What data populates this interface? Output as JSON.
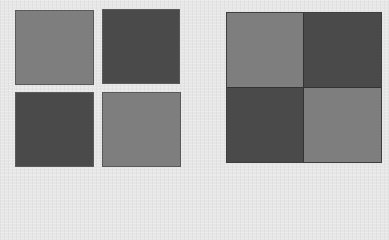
{
  "colors": {
    "background": "#e6e6e6",
    "light_square": "#7e7e7e",
    "dark_square": "#4a4a4a"
  },
  "left_group": {
    "layout": "2x2 separated squares",
    "squares": [
      {
        "position": "top-left",
        "tone": "light"
      },
      {
        "position": "top-right",
        "tone": "dark"
      },
      {
        "position": "bottom-left",
        "tone": "dark"
      },
      {
        "position": "bottom-right",
        "tone": "light"
      }
    ]
  },
  "right_group": {
    "layout": "2x2 joined checkerboard",
    "cells": [
      {
        "position": "top-left",
        "tone": "light"
      },
      {
        "position": "top-right",
        "tone": "dark"
      },
      {
        "position": "bottom-left",
        "tone": "dark"
      },
      {
        "position": "bottom-right",
        "tone": "light"
      }
    ]
  }
}
